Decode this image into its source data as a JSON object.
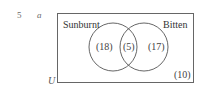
{
  "question": {
    "number": "5",
    "part": "a"
  },
  "venn": {
    "universal_label": "U",
    "sets": [
      {
        "name": "Sunburnt"
      },
      {
        "name": "Bitten"
      }
    ],
    "regions": {
      "only_sunburnt": "(18)",
      "both": "(5)",
      "only_bitten": "(17)",
      "neither": "(10)"
    }
  },
  "colors": {
    "line": "#555555",
    "text": "#3a3a3a"
  }
}
